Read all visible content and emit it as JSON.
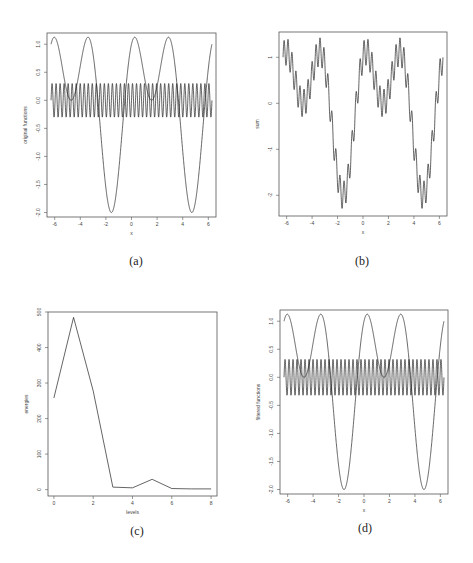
{
  "figure": {
    "captions": [
      "(a)",
      "(b)",
      "(c)",
      "(d)"
    ]
  },
  "chart_data": [
    {
      "panel": "(a)",
      "type": "line",
      "title": "",
      "xlabel": "x",
      "ylabel": "original functions",
      "xlim": [
        -6.6,
        6.6
      ],
      "ylim": [
        -2.08,
        1.2
      ],
      "xticks": [
        -6,
        -4,
        -2,
        0,
        2,
        4,
        6
      ],
      "yticks": [
        -2.0,
        -1.5,
        -1.0,
        -0.5,
        0.0,
        0.5,
        1.0
      ],
      "ytick_labels": [
        "-2.0",
        "-1.5",
        "-1.0",
        "-0.5",
        "0.0",
        "0.5",
        "1.0"
      ],
      "grid": false,
      "series": [
        {
          "name": "low-frequency component",
          "formula": "sin(x)+cos(2x)",
          "x_range": [
            -6.283,
            6.283
          ],
          "min": -2.0,
          "max": 1.125
        },
        {
          "name": "high-frequency component",
          "formula": "0.3*sin(20x)",
          "x_range": [
            -6.283,
            6.283
          ],
          "min": -0.3,
          "max": 0.3
        }
      ]
    },
    {
      "panel": "(b)",
      "type": "line",
      "title": "",
      "xlabel": "x",
      "ylabel": "sum",
      "xlim": [
        -6.6,
        6.6
      ],
      "ylim": [
        -2.45,
        1.55
      ],
      "xticks": [
        -6,
        -4,
        -2,
        0,
        2,
        4,
        6
      ],
      "yticks": [
        -2,
        -1,
        0,
        1
      ],
      "ytick_labels": [
        "-2",
        "-1",
        "0",
        "1"
      ],
      "grid": false,
      "series": [
        {
          "name": "sum",
          "formula": "sin(x)+cos(2x)+0.3*sin(20x)",
          "x_range": [
            -6.283,
            6.283
          ],
          "min": -2.3,
          "max": 1.42
        }
      ]
    },
    {
      "panel": "(c)",
      "type": "line",
      "title": "",
      "xlabel": "levels",
      "ylabel": "energies",
      "xlim": [
        -0.3,
        8.3
      ],
      "ylim": [
        -18,
        500
      ],
      "xticks": [
        0,
        2,
        4,
        6,
        8
      ],
      "yticks": [
        0,
        100,
        200,
        300,
        400,
        500
      ],
      "ytick_labels": [
        "0",
        "100",
        "200",
        "300",
        "400",
        "500"
      ],
      "grid": false,
      "x": [
        0,
        1,
        2,
        3,
        4,
        5,
        6,
        7,
        8
      ],
      "series": [
        {
          "name": "energies",
          "values": [
            258,
            485,
            278,
            7,
            5,
            29,
            3,
            2,
            2
          ]
        }
      ]
    },
    {
      "panel": "(d)",
      "type": "line",
      "title": "",
      "xlabel": "x",
      "ylabel": "filtered functions",
      "xlim": [
        -6.6,
        6.6
      ],
      "ylim": [
        -2.08,
        1.2
      ],
      "xticks": [
        -6,
        -4,
        -2,
        0,
        2,
        4,
        6
      ],
      "yticks": [
        -2.0,
        -1.5,
        -1.0,
        -0.5,
        0.0,
        0.5,
        1.0
      ],
      "ytick_labels": [
        "-2.0",
        "-1.5",
        "-1.0",
        "-0.5",
        "0.0",
        "0.5",
        "1.0"
      ],
      "grid": false,
      "series": [
        {
          "name": "filtered low-frequency component",
          "formula": "sin(x)+cos(2x)",
          "x_range": [
            -6.283,
            6.283
          ],
          "min": -2.0,
          "max": 1.125
        },
        {
          "name": "filtered high-frequency component",
          "formula": "0.32*sin(20x)",
          "x_range": [
            -6.283,
            6.283
          ],
          "min": -0.32,
          "max": 0.32
        }
      ]
    }
  ],
  "layout": {
    "panels": [
      {
        "frame": [
          47,
          33,
          216,
          217
        ],
        "caption_pos": [
          136,
          262
        ]
      },
      {
        "frame": [
          279,
          32,
          447,
          216
        ],
        "caption_pos": [
          362,
          262
        ]
      },
      {
        "frame": [
          48,
          312,
          217,
          496
        ],
        "caption_pos": [
          137,
          532
        ]
      },
      {
        "frame": [
          280,
          310,
          448,
          494
        ],
        "caption_pos": [
          365,
          529
        ]
      }
    ]
  }
}
